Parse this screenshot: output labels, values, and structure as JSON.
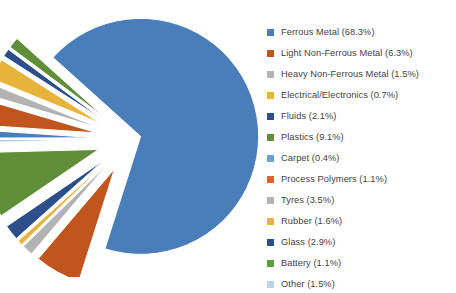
{
  "chart_data": {
    "type": "pie",
    "title": "",
    "exploded": true,
    "legend_position": "right",
    "grid": false,
    "unit": "%",
    "categories": [
      "Ferrous Metal",
      "Light Non-Ferrous Metal",
      "Heavy Non-Ferrous Metal",
      "Electrical/Electronics",
      "Fluids",
      "Plastics",
      "Carpet",
      "Process Polymers",
      "Tyres",
      "Rubber",
      "Glass",
      "Battery",
      "Other"
    ],
    "values": [
      68.3,
      6.3,
      1.5,
      0.7,
      2.1,
      9.1,
      0.4,
      1.1,
      3.5,
      1.6,
      2.9,
      1.1,
      1.5
    ],
    "colors": [
      "#4a7ebb",
      "#c0561e",
      "#b3b3b3",
      "#e8b33a",
      "#2c4f8c",
      "#5f8f38",
      "#a8c6e5",
      "#4a7ebb",
      "#c0561e",
      "#b3b3b3",
      "#e8b33a",
      "#2c4f8c",
      "#5f8f38",
      "#a8c6e5"
    ],
    "legend_entries": [
      {
        "label": "Ferrous Metal (68.3%)",
        "color": "#4a7ebb"
      },
      {
        "label": "Light Non-Ferrous Metal (6.3%)",
        "color": "#c0561e"
      },
      {
        "label": "Heavy Non-Ferrous Metal (1.5%)",
        "color": "#b3b3b3"
      },
      {
        "label": "Electrical/Electronics (0.7%)",
        "color": "#e8b33a"
      },
      {
        "label": "Fluids (2.1%)",
        "color": "#2c4f8c"
      },
      {
        "label": "Plastics (9.1%)",
        "color": "#5f8f38"
      },
      {
        "label": "Carpet (0.4%)",
        "color": "#6ba3d6"
      },
      {
        "label": "Process Polymers (1.1%)",
        "color": "#e2622c"
      },
      {
        "label": "Tyres (3.5%)",
        "color": "#b3b3b3"
      },
      {
        "label": "Rubber (1.6%)",
        "color": "#e8b33a"
      },
      {
        "label": "Glass (2.9%)",
        "color": "#2c4f8c"
      },
      {
        "label": "Battery (1.1%)",
        "color": "#5f9e3c"
      },
      {
        "label": "Other (1.5%)",
        "color": "#b8d3ea"
      }
    ]
  },
  "background": "#ffffff"
}
